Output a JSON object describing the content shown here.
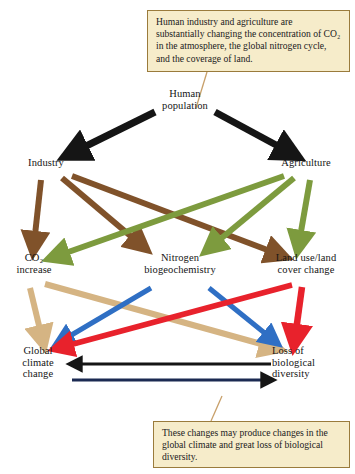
{
  "figure": {
    "type": "flow-diagram"
  },
  "callouts": {
    "top": "Human industry and agriculture are substantially changing the concentration of CO₂ in the atmosphere, the global nitrogen cycle, and the coverage of land.",
    "bottom": "These changes may produce changes in the global climate and great loss of biological diversity."
  },
  "nodes": {
    "human_population": {
      "line1": "Human",
      "line2": "population"
    },
    "industry": {
      "line1": "Industry"
    },
    "agriculture": {
      "line1": "Agriculture"
    },
    "co2_increase": {
      "line1": "CO₂",
      "line2": "increase"
    },
    "nitrogen": {
      "line1": "Nitrogen",
      "line2": "biogeochemistry"
    },
    "land_use": {
      "line1": "Land use/land",
      "line2": "cover change"
    },
    "global_climate": {
      "line1": "Global",
      "line2": "climate",
      "line3": "change"
    },
    "biodiversity_loss": {
      "line1": "Loss of",
      "line2": "biological",
      "line3": "diversity"
    }
  },
  "colors": {
    "black": "#151515",
    "brown": "#80522a",
    "green": "#7d9b3e",
    "tan": "#d5b483",
    "blue": "#2f6fc4",
    "red": "#e8222c",
    "navy": "#1b2a52",
    "callout_bg": "#f6ecca",
    "callout_border": "#9a7b3c",
    "pointer": "#c8a06a"
  },
  "edges": [
    {
      "from": "human_population",
      "to": "industry",
      "color": "black"
    },
    {
      "from": "human_population",
      "to": "agriculture",
      "color": "black"
    },
    {
      "from": "industry",
      "to": "co2_increase",
      "color": "brown"
    },
    {
      "from": "industry",
      "to": "nitrogen",
      "color": "brown"
    },
    {
      "from": "industry",
      "to": "land_use",
      "color": "brown"
    },
    {
      "from": "agriculture",
      "to": "co2_increase",
      "color": "green"
    },
    {
      "from": "agriculture",
      "to": "nitrogen",
      "color": "green"
    },
    {
      "from": "agriculture",
      "to": "land_use",
      "color": "green"
    },
    {
      "from": "co2_increase",
      "to": "global_climate",
      "color": "tan"
    },
    {
      "from": "co2_increase",
      "to": "biodiversity_loss",
      "color": "tan"
    },
    {
      "from": "nitrogen",
      "to": "global_climate",
      "color": "blue"
    },
    {
      "from": "nitrogen",
      "to": "biodiversity_loss",
      "color": "blue"
    },
    {
      "from": "land_use",
      "to": "global_climate",
      "color": "red"
    },
    {
      "from": "land_use",
      "to": "biodiversity_loss",
      "color": "red"
    },
    {
      "from": "biodiversity_loss",
      "to": "global_climate",
      "color": "black"
    },
    {
      "from": "global_climate",
      "to": "biodiversity_loss",
      "color": "navy"
    }
  ]
}
